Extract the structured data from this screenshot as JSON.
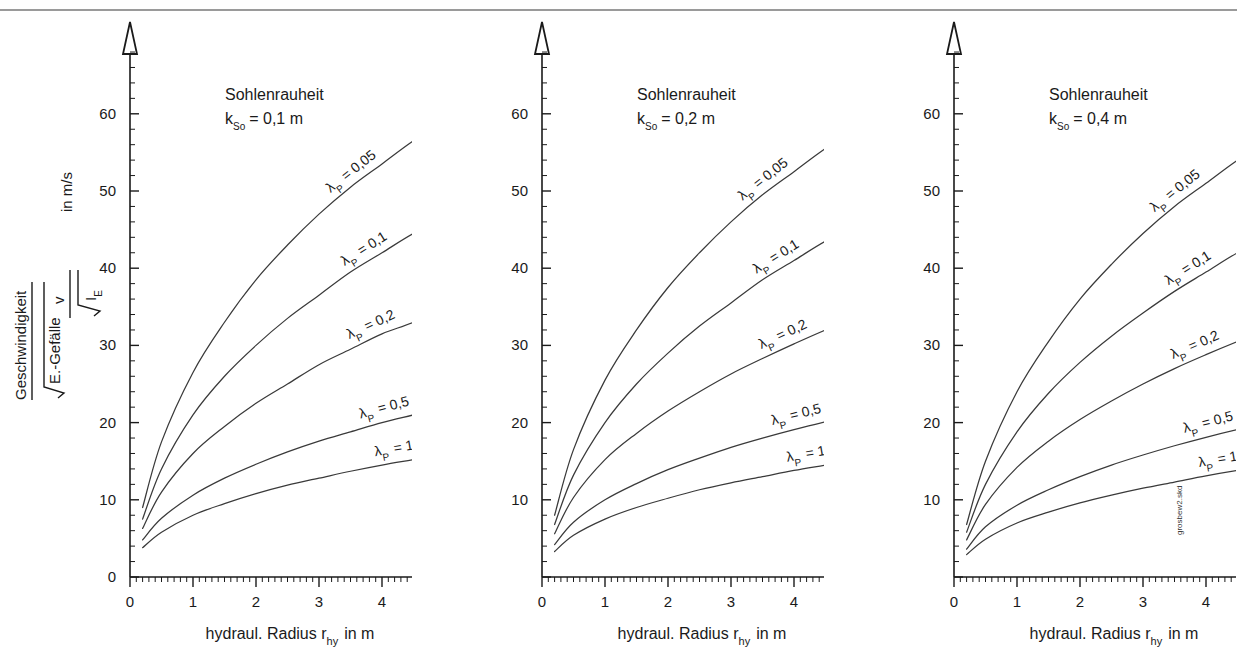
{
  "document": {
    "title": "Geschwindigkeitsdiagramme für Sohlenrauheit",
    "watermark": "grosbew2.skd"
  },
  "axes": {
    "x_title_main": "hydraul. Radius",
    "x_title_symbol": "r",
    "x_title_symbol_sub": "hy",
    "x_title_unit": "in m",
    "x_ticks": [
      "0",
      "1",
      "2",
      "3",
      "4",
      "5"
    ],
    "y_ticks_first": [
      "0",
      "10",
      "20",
      "30",
      "40",
      "50",
      "60"
    ],
    "y_ticks_other": [
      "10",
      "20",
      "30",
      "40",
      "50",
      "60"
    ],
    "y_label_numerator": "Geschwindigkeit",
    "y_label_denominator": "E.-Gefälle",
    "y_label_formula_numerator": "v",
    "y_label_formula_denominator": "I",
    "y_label_formula_denominator_sub": "E",
    "y_label_unit": "in m/s"
  },
  "panels": [
    {
      "id": "panel-1",
      "title_line1": "Sohlenrauheit",
      "title_symbol": "k",
      "title_symbol_sub": "So",
      "title_value": "= 0,1 m",
      "k_so": 0.1
    },
    {
      "id": "panel-2",
      "title_line1": "Sohlenrauheit",
      "title_symbol": "k",
      "title_symbol_sub": "So",
      "title_value": "= 0,2 m",
      "k_so": 0.2
    },
    {
      "id": "panel-3",
      "title_line1": "Sohlenrauheit",
      "title_symbol": "k",
      "title_symbol_sub": "So",
      "title_value": "= 0,4 m",
      "k_so": 0.4
    }
  ],
  "curve_labels": [
    {
      "lambda_symbol": "λ",
      "sub": "P",
      "eq": "= 0,05",
      "value": 0.05
    },
    {
      "lambda_symbol": "λ",
      "sub": "P",
      "eq": "= 0,1",
      "value": 0.1
    },
    {
      "lambda_symbol": "λ",
      "sub": "P",
      "eq": "= 0,2",
      "value": 0.2
    },
    {
      "lambda_symbol": "λ",
      "sub": "P",
      "eq": "= 0,5",
      "value": 0.5
    },
    {
      "lambda_symbol": "λ",
      "sub": "P",
      "eq": "= 1",
      "value": 1
    }
  ],
  "colors": {
    "curve": "#3a3a3a",
    "axis": "#1a1a1a",
    "text": "#1a1a1a",
    "rule": "#9a9a9a"
  },
  "chart_data": {
    "type": "line",
    "xlabel": "hydraul. Radius r_hy in m",
    "ylabel": "Geschwindigkeit / √E.-Gefälle = v / √I_E in m/s",
    "xlim": [
      0,
      5.4
    ],
    "ylim": [
      0,
      68
    ],
    "grid": false,
    "legend": "inline-curve-labels",
    "x": [
      0.2,
      0.5,
      1.0,
      1.5,
      2.0,
      2.5,
      3.0,
      3.5,
      4.0,
      4.5,
      5.0
    ],
    "panels": [
      {
        "name": "k_So = 0,1 m",
        "k_so": 0.1,
        "series": [
          {
            "name": "λ_P = 0,05",
            "lambda_p": 0.05,
            "values": [
              9.0,
              17.5,
              26.5,
              33.0,
              38.5,
              43.0,
              47.0,
              50.5,
              53.5,
              56.5,
              59.0
            ]
          },
          {
            "name": "λ_P = 0,1",
            "lambda_p": 0.1,
            "values": [
              7.5,
              14.0,
              21.0,
              26.0,
              30.0,
              33.5,
              36.5,
              39.5,
              42.0,
              44.5,
              46.5
            ]
          },
          {
            "name": "λ_P = 0,2",
            "lambda_p": 0.2,
            "values": [
              6.3,
              11.0,
              16.0,
              19.5,
              22.5,
              25.0,
              27.5,
              29.5,
              31.5,
              33.0,
              35.0
            ]
          },
          {
            "name": "λ_P = 0,5",
            "lambda_p": 0.5,
            "values": [
              4.8,
              7.6,
              10.6,
              12.8,
              14.6,
              16.2,
              17.6,
              18.8,
              20.0,
              21.0,
              22.0
            ]
          },
          {
            "name": "λ_P = 1",
            "lambda_p": 1.0,
            "values": [
              3.8,
              5.8,
              8.0,
              9.5,
              10.8,
              11.9,
              12.8,
              13.7,
              14.5,
              15.2,
              15.9
            ]
          }
        ]
      },
      {
        "name": "k_So = 0,2 m",
        "k_so": 0.2,
        "series": [
          {
            "name": "λ_P = 0,05",
            "lambda_p": 0.05,
            "values": [
              8.0,
              16.5,
              25.5,
              32.0,
              37.5,
              42.0,
              46.0,
              49.5,
              52.5,
              55.5,
              58.0
            ]
          },
          {
            "name": "λ_P = 0,1",
            "lambda_p": 0.1,
            "values": [
              6.8,
              13.2,
              20.0,
              25.0,
              29.0,
              32.5,
              35.5,
              38.5,
              41.0,
              43.5,
              45.5
            ]
          },
          {
            "name": "λ_P = 0,2",
            "lambda_p": 0.2,
            "values": [
              5.6,
              10.3,
              15.2,
              18.6,
              21.5,
              24.0,
              26.3,
              28.3,
              30.2,
              32.0,
              33.6
            ]
          },
          {
            "name": "λ_P = 0,5",
            "lambda_p": 0.5,
            "values": [
              4.2,
              7.1,
              10.0,
              12.1,
              13.9,
              15.4,
              16.8,
              18.0,
              19.1,
              20.1,
              21.1
            ]
          },
          {
            "name": "λ_P = 1",
            "lambda_p": 1.0,
            "values": [
              3.3,
              5.4,
              7.5,
              9.0,
              10.2,
              11.3,
              12.2,
              13.0,
              13.8,
              14.5,
              15.2
            ]
          }
        ]
      },
      {
        "name": "k_So = 0,4 m",
        "k_so": 0.4,
        "series": [
          {
            "name": "λ_P = 0,05",
            "lambda_p": 0.05,
            "values": [
              6.8,
              15.0,
              24.0,
              30.5,
              36.0,
              40.5,
              44.5,
              48.0,
              51.0,
              54.0,
              56.5
            ]
          },
          {
            "name": "λ_P = 0,1",
            "lambda_p": 0.1,
            "values": [
              5.8,
              12.0,
              18.8,
              23.8,
              27.8,
              31.2,
              34.2,
              37.0,
              39.5,
              42.0,
              44.0
            ]
          },
          {
            "name": "λ_P = 0,2",
            "lambda_p": 0.2,
            "values": [
              4.8,
              9.4,
              14.2,
              17.6,
              20.4,
              22.8,
              25.0,
              27.0,
              28.8,
              30.5,
              32.1
            ]
          },
          {
            "name": "λ_P = 0,5",
            "lambda_p": 0.5,
            "values": [
              3.6,
              6.5,
              9.3,
              11.3,
              13.0,
              14.5,
              15.8,
              17.0,
              18.1,
              19.1,
              20.0
            ]
          },
          {
            "name": "λ_P = 1",
            "lambda_p": 1.0,
            "values": [
              2.9,
              4.9,
              7.0,
              8.4,
              9.6,
              10.6,
              11.5,
              12.3,
              13.1,
              13.8,
              14.4
            ]
          }
        ]
      }
    ]
  }
}
